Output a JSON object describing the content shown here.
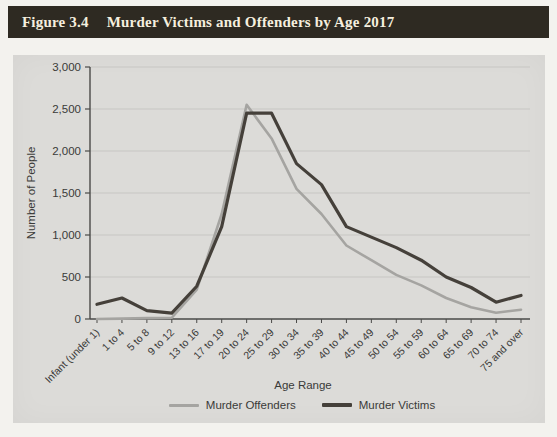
{
  "figure": {
    "label": "Figure 3.4",
    "title": "Murder Victims and Offenders by Age 2017"
  },
  "chart_data": {
    "type": "line",
    "title": "",
    "xlabel": "Age Range",
    "ylabel": "Number of People",
    "ylim": [
      0,
      3000
    ],
    "ytick_step": 500,
    "ytick_labels": [
      "0",
      "500",
      "1,000",
      "1,500",
      "2,000",
      "2,500",
      "3,000"
    ],
    "grid": true,
    "legend_position": "bottom",
    "categories": [
      "Infant (under 1)",
      "1 to 4",
      "5 to 8",
      "9 to 12",
      "13 to 16",
      "17 to 19",
      "20 to 24",
      "25 to 29",
      "30 to 34",
      "35 to 39",
      "40 to 44",
      "45 to 49",
      "50 to 54",
      "55 to 59",
      "60 to 64",
      "65 to 69",
      "70 to 74",
      "75 and over"
    ],
    "series": [
      {
        "name": "Murder Offenders",
        "color": "#a5a4a1",
        "values": [
          0,
          5,
          10,
          15,
          350,
          1250,
          2550,
          2150,
          1550,
          1250,
          875,
          700,
          525,
          400,
          250,
          140,
          75,
          110
        ]
      },
      {
        "name": "Murder Victims",
        "color": "#45403a",
        "values": [
          175,
          250,
          100,
          70,
          390,
          1100,
          2450,
          2450,
          1850,
          1600,
          1100,
          975,
          850,
          700,
          500,
          375,
          200,
          280
        ]
      }
    ]
  },
  "colors": {
    "header_bg": "#2e2a22",
    "header_text": "#f5efdf",
    "panel_bg": "#dcdbd8",
    "axis": "#4a4a48",
    "gridline": "#c7c6c3",
    "tick_text": "#3a3a38"
  }
}
